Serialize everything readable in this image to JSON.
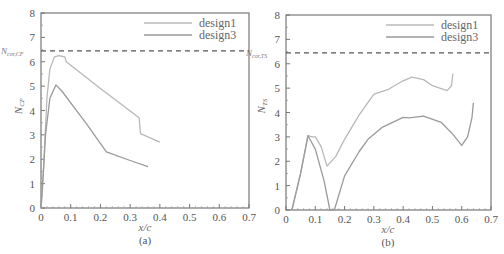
{
  "chart_data": [
    {
      "type": "line",
      "panel": "(a)",
      "caption": "(a)",
      "xlabel": "x/c",
      "ylabel": "N_CF",
      "xlim": [
        0,
        0.7
      ],
      "ylim": [
        0,
        8
      ],
      "xticks": [
        0,
        0.1,
        0.2,
        0.3,
        0.4,
        0.5,
        0.6,
        0.7
      ],
      "xtick_labels": [
        "0",
        "0.1",
        "0.2",
        "0.3",
        "0.4",
        "0.5",
        "0.6",
        "0.7"
      ],
      "yticks": [
        0,
        1,
        2,
        3,
        4,
        5,
        6,
        7,
        8
      ],
      "ytick_labels": [
        "0",
        "1",
        "2",
        "3",
        "4",
        "5",
        "6",
        "7",
        "8"
      ],
      "grid": false,
      "legend_position": "upper right",
      "reference_line": {
        "label": "N_cor,CF",
        "value": 6.45,
        "style": "dashed"
      },
      "series": [
        {
          "name": "design1",
          "color": "#b8b8b8",
          "x": [
            0,
            0.005,
            0.01,
            0.02,
            0.03,
            0.045,
            0.06,
            0.08,
            0.085,
            0.2,
            0.33,
            0.335,
            0.4
          ],
          "y": [
            0,
            0.8,
            2.0,
            4.5,
            5.7,
            6.2,
            6.25,
            6.2,
            6.0,
            4.9,
            3.7,
            3.05,
            2.7
          ]
        },
        {
          "name": "design3",
          "color": "#9a9a9a",
          "x": [
            0,
            0.008,
            0.015,
            0.03,
            0.05,
            0.07,
            0.15,
            0.22,
            0.3,
            0.36
          ],
          "y": [
            0,
            1.5,
            3.0,
            4.5,
            5.05,
            4.8,
            3.5,
            2.3,
            1.95,
            1.7
          ]
        }
      ]
    },
    {
      "type": "line",
      "panel": "(b)",
      "caption": "(b)",
      "xlabel": "x/c",
      "ylabel": "N_TS",
      "xlim": [
        0,
        0.7
      ],
      "ylim": [
        0,
        8
      ],
      "xticks": [
        0,
        0.1,
        0.2,
        0.3,
        0.4,
        0.5,
        0.6,
        0.7
      ],
      "xtick_labels": [
        "0",
        "0.1",
        "0.2",
        "0.3",
        "0.4",
        "0.5",
        "0.6",
        "0.7"
      ],
      "yticks": [
        0,
        1,
        2,
        3,
        4,
        5,
        6,
        7,
        8
      ],
      "ytick_labels": [
        "0",
        "1",
        "2",
        "3",
        "4",
        "5",
        "6",
        "7",
        "8"
      ],
      "grid": false,
      "legend_position": "upper right",
      "reference_line": {
        "label": "N_cor,TS",
        "value": 6.45,
        "style": "dashed"
      },
      "series": [
        {
          "name": "design1",
          "color": "#b8b8b8",
          "x": [
            0.02,
            0.05,
            0.075,
            0.09,
            0.1,
            0.12,
            0.14,
            0.17,
            0.2,
            0.25,
            0.3,
            0.35,
            0.4,
            0.43,
            0.47,
            0.5,
            0.55,
            0.565,
            0.57
          ],
          "y": [
            0,
            1.5,
            3.05,
            3.0,
            3.0,
            2.6,
            1.8,
            2.2,
            2.9,
            3.9,
            4.75,
            4.95,
            5.3,
            5.45,
            5.35,
            5.1,
            4.9,
            5.1,
            5.6
          ]
        },
        {
          "name": "design3",
          "color": "#9a9a9a",
          "x": [
            0.02,
            0.05,
            0.075,
            0.1,
            0.13,
            0.15,
            0.165,
            0.2,
            0.25,
            0.28,
            0.33,
            0.4,
            0.42,
            0.47,
            0.53,
            0.57,
            0.6,
            0.62,
            0.635,
            0.64
          ],
          "y": [
            0,
            1.5,
            3.05,
            2.5,
            1.2,
            0,
            0,
            1.4,
            2.4,
            2.9,
            3.4,
            3.8,
            3.78,
            3.85,
            3.6,
            3.1,
            2.65,
            3.0,
            3.8,
            4.4
          ]
        }
      ]
    }
  ],
  "panels": [
    {
      "caption": "(a)",
      "xlabel": "x/c",
      "ylabel_main": "N",
      "ylabel_sub": "CF",
      "ref_main": "N",
      "ref_sub": "cor,CF",
      "legend": [
        "design1",
        "design3"
      ]
    },
    {
      "caption": "(b)",
      "xlabel": "x/c",
      "ylabel_main": "N",
      "ylabel_sub": "TS",
      "ref_main": "N",
      "ref_sub": "cor,TS",
      "legend": [
        "design1",
        "design3"
      ]
    }
  ]
}
